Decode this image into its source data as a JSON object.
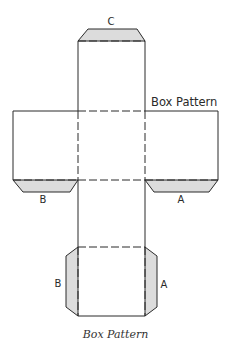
{
  "diagram": {
    "title_label": "Box Pattern",
    "caption": "Box Pattern",
    "tab_labels": {
      "top": "C",
      "left_flap": "B",
      "right_flap": "A",
      "bottom_left": "B",
      "bottom_right": "A"
    },
    "colors": {
      "line": "#2a2a2a",
      "tab_fill": "#dcdcdc",
      "background": "#ffffff"
    },
    "legend": {
      "solid_line": "cut line",
      "dashed_line": "fold line",
      "shaded": "glue tab"
    }
  }
}
